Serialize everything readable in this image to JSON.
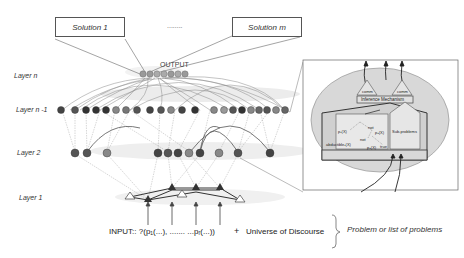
{
  "solutions": {
    "first": "Solution 1",
    "ellipsis": "........",
    "last": "Solution m"
  },
  "output_label": "OUTPUT",
  "layers": [
    {
      "label": "Layer n"
    },
    {
      "label": "Layer n -1"
    },
    {
      "label": "Layer 2"
    },
    {
      "label": "Layer 1"
    }
  ],
  "input": {
    "prefix": "INPUT:: ?(p",
    "text": "INPUT:: ?(p₁(...),  .......  ...pᵣ(...))",
    "plus": "+",
    "universe": "Universe of Discourse"
  },
  "brace_note": "Problem or list of problems",
  "inset": {
    "comm_left": "comm",
    "comm_right": "comm",
    "inference": "Inference Mechanism",
    "sub_problems": "Sub-problems",
    "nodes": [
      "p₁(X)",
      "not",
      "p₂(X)",
      "not",
      "abductible₁(X)",
      "p₃(X)",
      "true"
    ]
  },
  "colors": {
    "node_dark": "#3a3a3a",
    "node_mid": "#6a6a6a",
    "node_light": "#9a9a9a",
    "ellipse": "#d6d6d6",
    "edge": "#777777"
  }
}
